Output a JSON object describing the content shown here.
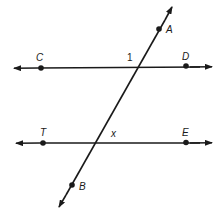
{
  "diagram": {
    "type": "parallel lines cut by a transversal",
    "colors": {
      "line": "#1a1a1a",
      "background": "#ffffff"
    },
    "lines": [
      {
        "name": "line-CD",
        "points": [
          "C",
          "D"
        ],
        "arrows": "both"
      },
      {
        "name": "line-TE",
        "points": [
          "T",
          "E"
        ],
        "arrows": "both"
      },
      {
        "name": "transversal-AB",
        "points": [
          "A",
          "B"
        ],
        "arrows": "both"
      }
    ],
    "points": {
      "A": {
        "label": "A"
      },
      "B": {
        "label": "B"
      },
      "C": {
        "label": "C"
      },
      "D": {
        "label": "D"
      },
      "T": {
        "label": "T"
      },
      "E": {
        "label": "E"
      }
    },
    "angles": {
      "angle1": {
        "label": "1"
      },
      "angleX": {
        "label": "x"
      }
    }
  }
}
